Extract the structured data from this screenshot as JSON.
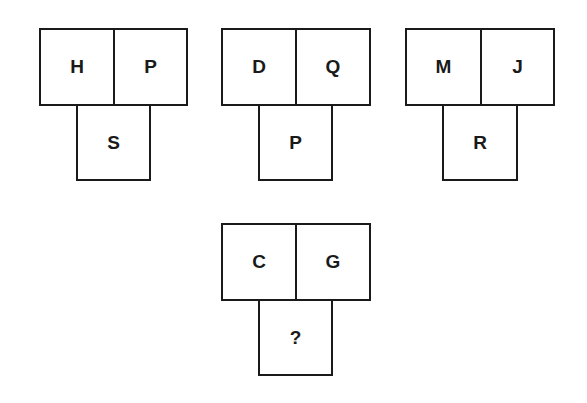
{
  "puzzle": {
    "figures": [
      {
        "top_left": "H",
        "top_right": "P",
        "bottom": "S"
      },
      {
        "top_left": "D",
        "top_right": "Q",
        "bottom": "P"
      },
      {
        "top_left": "M",
        "top_right": "J",
        "bottom": "R"
      },
      {
        "top_left": "C",
        "top_right": "G",
        "bottom": "?"
      }
    ]
  }
}
